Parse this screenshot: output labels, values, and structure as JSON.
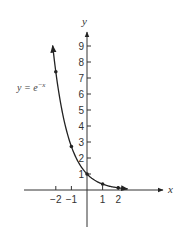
{
  "chart_data": {
    "type": "line",
    "title": "",
    "xlabel": "x",
    "ylabel": "y",
    "xlim": [
      -3,
      3.7
    ],
    "ylim": [
      -2,
      10
    ],
    "grid": false,
    "x_ticks": [
      -2,
      -1,
      1,
      2
    ],
    "x_tick_labels": [
      "−2",
      "−1",
      "1",
      "2"
    ],
    "y_ticks": [
      1,
      2,
      3,
      4,
      5,
      6,
      7,
      8,
      9
    ],
    "y_tick_labels": [
      "1",
      "2",
      "3",
      "4",
      "5",
      "6",
      "7",
      "8",
      "9"
    ],
    "series": [
      {
        "name": "y = e^{-x}",
        "function": "e^(-x)",
        "points": [
          {
            "x": -2,
            "y": 7.39
          },
          {
            "x": -1,
            "y": 2.72
          },
          {
            "x": 0,
            "y": 1
          },
          {
            "x": 1,
            "y": 0.37
          },
          {
            "x": 2,
            "y": 0.14
          }
        ]
      }
    ],
    "annotations": [
      {
        "text": "y = e^{-x}",
        "near": {
          "x": -2,
          "y": 7.3
        }
      }
    ],
    "color": "#222222"
  },
  "labels": {
    "x_axis": "x",
    "y_axis": "y",
    "fn_lhs": "y = e",
    "fn_exp": "−x"
  }
}
